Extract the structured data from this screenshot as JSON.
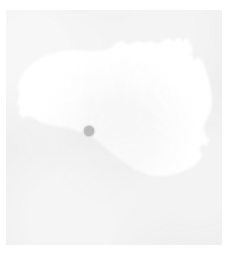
{
  "figure": {
    "kind": "region-map-thumbnail",
    "width": 231,
    "height": 269,
    "caption": ""
  },
  "colors": {
    "page_background": "#ffffff",
    "map_background": "#eeeeee",
    "region_fill": "#ffffff",
    "marker_fill": "#999999",
    "marker_halo": "#bdbdbd"
  },
  "canvas": {
    "left": 6,
    "top": 10,
    "width": 216,
    "height": 235
  },
  "region": {
    "name": "region-outline",
    "fill": "#ffffff",
    "path": "M 12 76 L 16 64 L 24 56 L 33 49 L 44 44 L 56 41 L 68 40 L 80 41 L 92 41 L 104 39 L 110 33 L 116 30 L 121 34 L 127 33 L 133 31 L 139 33 L 145 31 L 151 34 L 157 31 L 163 28 L 168 32 L 172 27 L 177 31 L 181 28 L 184 33 L 187 39 L 185 45 L 189 50 L 193 47 L 197 52 L 200 60 L 203 70 L 205 80 L 206 90 L 205 100 L 201 109 L 197 117 L 199 124 L 203 130 L 200 136 L 196 133 L 193 139 L 196 146 L 192 152 L 186 157 L 178 161 L 169 164 L 159 166 L 148 166 L 137 163 L 127 158 L 117 152 L 108 145 L 100 138 L 92 131 L 84 126 L 75 122 L 66 119 L 57 117 L 48 116 L 40 114 L 33 111 L 27 107 L 22 106 L 17 108 L 13 104 L 14 98 L 11 93 L 13 86 Z"
  },
  "marker": {
    "name": "location-marker",
    "cx": 83,
    "cy": 121,
    "r": 5.2,
    "halo_r": 6.6,
    "fill": "#999999",
    "label": ""
  }
}
